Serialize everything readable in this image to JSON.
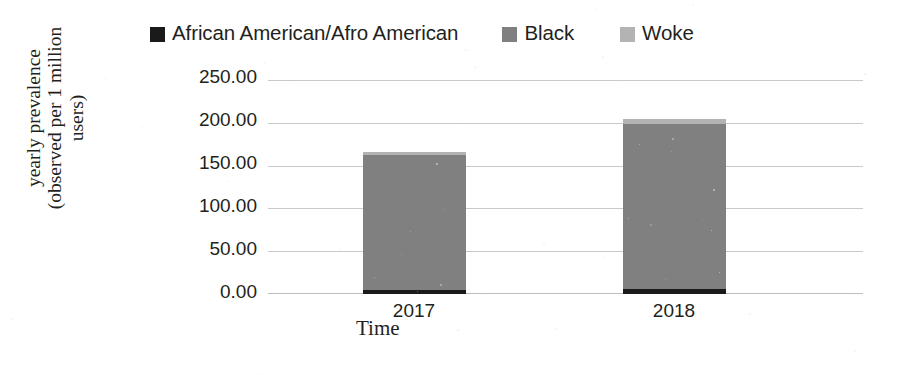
{
  "legend": {
    "position": "top",
    "items": [
      {
        "label": "African American/Afro American",
        "color": "#1a1a1a",
        "icon": "legend-swatch-icon"
      },
      {
        "label": "Black",
        "color": "#808080",
        "icon": "legend-swatch-icon"
      },
      {
        "label": "Woke",
        "color": "#b3b3b3",
        "icon": "legend-swatch-icon"
      }
    ]
  },
  "axes": {
    "y": {
      "title_line1": "yearly prevalence",
      "title_line2": "(observed per 1 million",
      "title_line3": "users)",
      "ticks": [
        "250.00",
        "200.00",
        "150.00",
        "100.00",
        "50.00",
        "0.00"
      ]
    },
    "x": {
      "title": "Time",
      "ticks": [
        "2017",
        "2018"
      ]
    }
  },
  "chart_data": {
    "type": "bar",
    "stacked": true,
    "title": "",
    "subtitle": "",
    "xlabel": "Time",
    "ylabel": "yearly prevalence (observed per 1 million users)",
    "categories": [
      "2017",
      "2018"
    ],
    "series": [
      {
        "name": "African American/Afro American",
        "color": "#1a1a1a",
        "values": [
          5.0,
          6.0
        ]
      },
      {
        "name": "Black",
        "color": "#808080",
        "values": [
          158.0,
          194.0
        ]
      },
      {
        "name": "Woke",
        "color": "#b3b3b3",
        "values": [
          4.0,
          5.0
        ]
      }
    ],
    "totals": [
      167.0,
      205.0
    ],
    "ylim": [
      0,
      250
    ],
    "ytick_step": 50,
    "grid": true,
    "legend_position": "top",
    "xlim_categories": 2
  }
}
